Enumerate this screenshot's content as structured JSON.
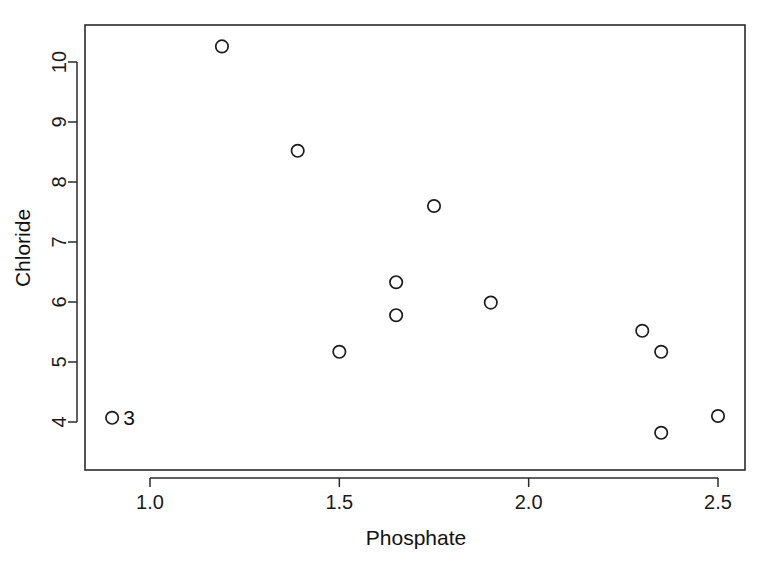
{
  "chart_data": {
    "type": "scatter",
    "title": "",
    "xlabel": "Phosphate",
    "ylabel": "Chloride",
    "xlim": [
      0.83,
      2.57
    ],
    "ylim": [
      3.55,
      10.6
    ],
    "grid": false,
    "legend": "none",
    "xticks": [
      1.0,
      1.5,
      2.0,
      2.5
    ],
    "xtick_labels": [
      "1.0",
      "1.5",
      "2.0",
      "2.5"
    ],
    "yticks": [
      4,
      5,
      6,
      7,
      8,
      9,
      10
    ],
    "ytick_labels": [
      "4",
      "5",
      "6",
      "7",
      "8",
      "9",
      "10"
    ],
    "marker": "open-circle",
    "marker_color": "#1c1c1c",
    "points": [
      {
        "x": 0.9,
        "y": 4.07,
        "label": "3"
      },
      {
        "x": 1.19,
        "y": 10.26,
        "label": ""
      },
      {
        "x": 1.39,
        "y": 8.52,
        "label": ""
      },
      {
        "x": 1.5,
        "y": 5.17,
        "label": ""
      },
      {
        "x": 1.65,
        "y": 6.33,
        "label": ""
      },
      {
        "x": 1.65,
        "y": 5.78,
        "label": ""
      },
      {
        "x": 1.75,
        "y": 7.6,
        "label": ""
      },
      {
        "x": 1.9,
        "y": 5.99,
        "label": ""
      },
      {
        "x": 2.3,
        "y": 5.52,
        "label": ""
      },
      {
        "x": 2.35,
        "y": 5.17,
        "label": ""
      },
      {
        "x": 2.35,
        "y": 3.82,
        "label": ""
      },
      {
        "x": 2.5,
        "y": 4.1,
        "label": ""
      }
    ]
  },
  "colors": {
    "background": "#ffffff",
    "axis": "#2b2b2b",
    "text": "#111111",
    "marker": "#1c1c1c"
  }
}
